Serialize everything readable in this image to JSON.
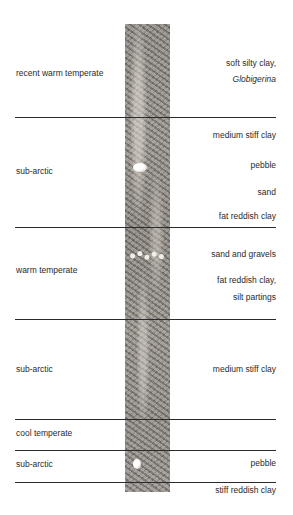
{
  "diagram": {
    "type": "sediment core stratigraphic column",
    "zones": [
      {
        "climate": "recent warm temperate",
        "sediments": [
          "soft silty clay,",
          "Globigerina"
        ]
      },
      {
        "climate": "sub-arctic",
        "sediments": [
          "medium stiff clay",
          "pebble",
          "sand",
          "fat reddish clay"
        ]
      },
      {
        "climate": "warm temperate",
        "sediments": [
          "sand and gravels",
          "fat reddish clay,",
          "silt partings"
        ]
      },
      {
        "climate": "sub-arctic",
        "sediments": [
          "medium stiff clay"
        ]
      },
      {
        "climate": "cool temperate",
        "sediments": []
      },
      {
        "climate": "sub-arctic",
        "sediments": [
          "pebble"
        ]
      },
      {
        "climate": "",
        "sediments": [
          "stiff reddish clay"
        ]
      }
    ],
    "colors": {
      "line": "#2b2b2b",
      "text": "#2a2a2a",
      "core": "#8e8882"
    }
  }
}
